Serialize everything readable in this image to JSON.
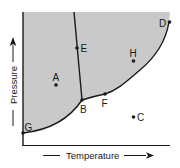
{
  "diagram": {
    "type": "phase-diagram",
    "colors": {
      "region_fill": "#c9c9c9",
      "line": "#1a1a1a",
      "background": "#ffffff"
    },
    "axes": {
      "x_label": "Temperature",
      "y_label": "Pressure"
    },
    "points": [
      {
        "id": "A",
        "label": "A"
      },
      {
        "id": "B",
        "label": "B"
      },
      {
        "id": "C",
        "label": "C"
      },
      {
        "id": "D",
        "label": "D"
      },
      {
        "id": "E",
        "label": "E"
      },
      {
        "id": "F",
        "label": "F"
      },
      {
        "id": "G",
        "label": "G"
      },
      {
        "id": "H",
        "label": "H"
      }
    ]
  }
}
